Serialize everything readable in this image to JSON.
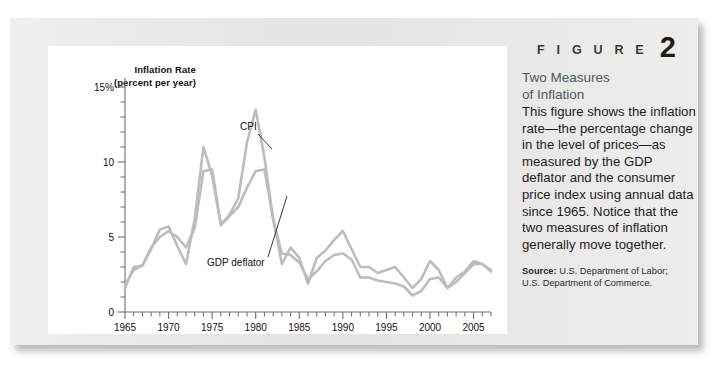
{
  "figure": {
    "word": "F I G U R E",
    "number": "2"
  },
  "caption": {
    "title_line1": "Two Measures",
    "title_line2": "of Inflation",
    "body": "This figure shows the inflation rate—the percentage change in the level of prices—as measured by the GDP deflator and the consumer price index using annual data since 1965. Notice that the two measures of inflation generally move together.",
    "source_label": "Source:",
    "source_text": " U.S. Department of Labor; U.S. Department of Commerce."
  },
  "chart_data": {
    "type": "line",
    "title": "",
    "ylabel_line1": "Inflation Rate",
    "ylabel_line2": "(percent per year)",
    "xlabel": "",
    "xlim": [
      1965,
      2007
    ],
    "ylim": [
      0,
      15.6
    ],
    "grid": false,
    "legend": "inline-annotations",
    "y_ticks_major": [
      0,
      5,
      10,
      15
    ],
    "y_tick_labels": [
      "0",
      "5",
      "10",
      "15%"
    ],
    "y_ticks_minor": [
      1,
      2,
      3,
      4,
      6,
      7,
      8,
      9,
      11,
      12,
      13,
      14
    ],
    "x_ticks_major": [
      1965,
      1970,
      1975,
      1980,
      1985,
      1990,
      1995,
      2000,
      2005
    ],
    "x_tick_labels": [
      "1965",
      "1970",
      "1975",
      "1980",
      "1985",
      "1990",
      "1995",
      "2000",
      "2005"
    ],
    "x_ticks_minor_step": 1,
    "line_color": "#bdbdbd",
    "x": [
      1965,
      1966,
      1967,
      1968,
      1969,
      1970,
      1971,
      1972,
      1973,
      1974,
      1975,
      1976,
      1977,
      1978,
      1979,
      1980,
      1981,
      1982,
      1983,
      1984,
      1985,
      1986,
      1987,
      1988,
      1989,
      1990,
      1991,
      1992,
      1993,
      1994,
      1995,
      1996,
      1997,
      1998,
      1999,
      2000,
      2001,
      2002,
      2003,
      2004,
      2005,
      2006,
      2007
    ],
    "series": [
      {
        "name": "CPI",
        "label": "CPI",
        "values": [
          1.6,
          3.0,
          3.1,
          4.2,
          5.5,
          5.7,
          4.4,
          3.2,
          6.2,
          11.0,
          9.1,
          5.8,
          6.5,
          7.6,
          11.3,
          13.5,
          10.3,
          6.2,
          3.2,
          4.3,
          3.6,
          1.9,
          3.6,
          4.1,
          4.8,
          5.4,
          4.2,
          3.0,
          3.0,
          2.6,
          2.8,
          3.0,
          2.3,
          1.6,
          2.2,
          3.4,
          2.8,
          1.6,
          2.3,
          2.7,
          3.4,
          3.2,
          2.8
        ]
      },
      {
        "name": "GDP deflator",
        "label": "GDP deflator",
        "values": [
          1.8,
          2.8,
          3.1,
          4.3,
          5.0,
          5.4,
          5.0,
          4.3,
          5.6,
          9.4,
          9.5,
          5.8,
          6.4,
          7.0,
          8.3,
          9.4,
          9.5,
          6.2,
          3.9,
          3.8,
          3.3,
          2.2,
          2.7,
          3.4,
          3.8,
          3.9,
          3.5,
          2.3,
          2.3,
          2.1,
          2.0,
          1.9,
          1.7,
          1.1,
          1.4,
          2.2,
          2.3,
          1.6,
          2.0,
          2.6,
          3.2,
          3.2,
          2.7
        ]
      }
    ],
    "annotations": [
      {
        "text": "CPI",
        "x_px": 230,
        "y_px": 112
      },
      {
        "text": "GDP deflator",
        "x_px": 197,
        "y_px": 248
      }
    ]
  }
}
